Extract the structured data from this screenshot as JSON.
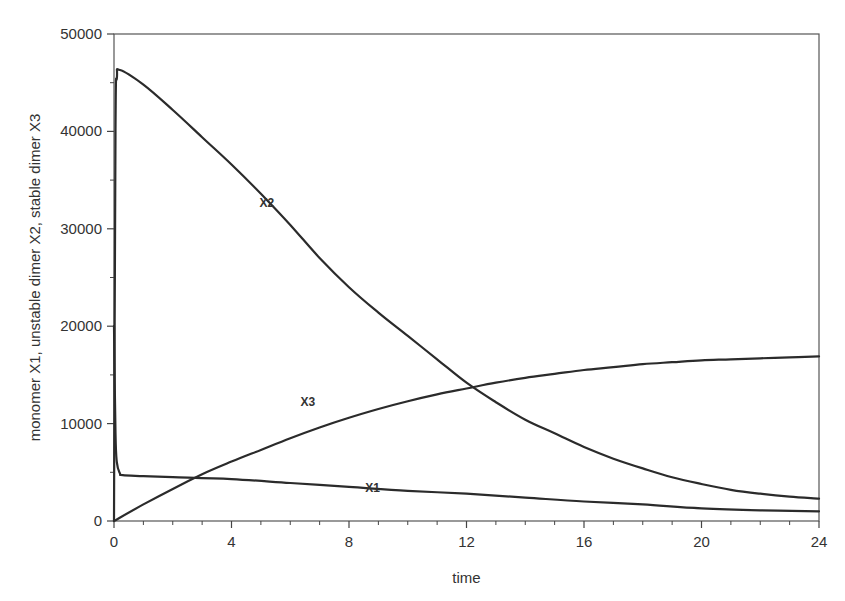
{
  "chart_data": {
    "type": "line",
    "title": "",
    "xlabel": "time",
    "ylabel": "monomer X1, unstable dimer X2, stable dimer X3",
    "xlim": [
      0,
      24
    ],
    "ylim": [
      0,
      50000
    ],
    "x_ticks": [
      0,
      4,
      8,
      12,
      16,
      20,
      24
    ],
    "x_tick_labels": [
      "0",
      "4",
      "8",
      "12",
      "16",
      "20",
      "24"
    ],
    "y_ticks": [
      0,
      10000,
      20000,
      30000,
      40000,
      50000
    ],
    "y_tick_labels": [
      "0",
      "10000",
      "20000",
      "30000",
      "40000",
      "50000"
    ],
    "grid": false,
    "legend": "none (inline series labels)",
    "series": [
      {
        "name": "X1",
        "label": "X1",
        "label_pos": [
          8.8,
          3000
        ],
        "x": [
          0,
          0.05,
          0.1,
          0.2,
          0.3,
          1,
          2,
          4,
          6,
          8,
          10,
          12,
          14,
          16,
          18,
          20,
          22,
          24
        ],
        "values": [
          20000,
          9000,
          6000,
          4900,
          4700,
          4600,
          4500,
          4300,
          3900,
          3500,
          3100,
          2800,
          2400,
          2000,
          1700,
          1300,
          1100,
          1000
        ]
      },
      {
        "name": "X2",
        "label": "X2",
        "label_pos": [
          5.2,
          32200
        ],
        "x": [
          0,
          0.05,
          0.1,
          0.2,
          1,
          2,
          3,
          4,
          5,
          6,
          7,
          8,
          9,
          10,
          11,
          12,
          13,
          14,
          15,
          16,
          17,
          18,
          19,
          20,
          21,
          22,
          23,
          24
        ],
        "values": [
          0,
          40000,
          45500,
          46300,
          44800,
          42200,
          39400,
          36600,
          33600,
          30400,
          27000,
          24000,
          21400,
          19000,
          16600,
          14200,
          12200,
          10400,
          9000,
          7600,
          6400,
          5400,
          4500,
          3800,
          3200,
          2800,
          2500,
          2300
        ]
      },
      {
        "name": "X3",
        "label": "X3",
        "label_pos": [
          6.6,
          11800
        ],
        "x": [
          0,
          1,
          2,
          3,
          4,
          5,
          6,
          7,
          8,
          9,
          10,
          11,
          12,
          13,
          14,
          15,
          16,
          17,
          18,
          19,
          20,
          21,
          22,
          23,
          24
        ],
        "values": [
          0,
          1700,
          3300,
          4800,
          6100,
          7300,
          8500,
          9600,
          10600,
          11500,
          12300,
          13000,
          13600,
          14200,
          14700,
          15100,
          15500,
          15800,
          16100,
          16300,
          16500,
          16600,
          16700,
          16800,
          16900
        ]
      }
    ]
  }
}
